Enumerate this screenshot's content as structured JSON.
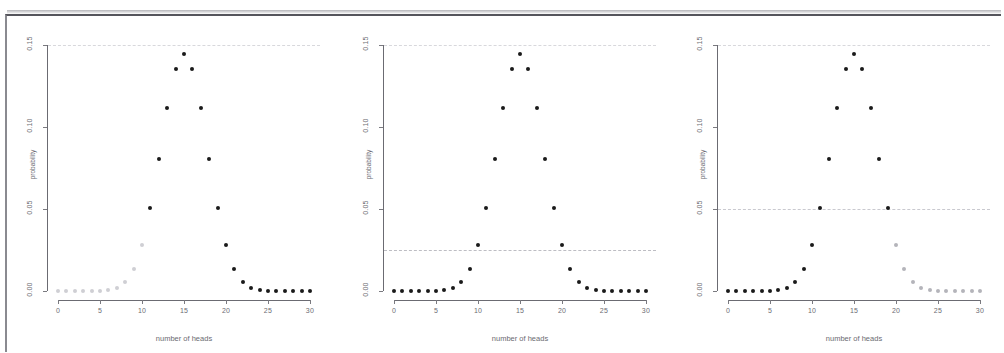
{
  "figure": {
    "panel_count": 3,
    "scan_frame": true
  },
  "chart_data": [
    {
      "type": "scatter",
      "title": "",
      "xlabel": "number of heads",
      "ylabel": "probability",
      "xlim": [
        -1.2,
        31.2
      ],
      "ylim": [
        0.0,
        0.152
      ],
      "xticks": [
        0,
        5,
        10,
        15,
        20,
        25,
        30
      ],
      "xticklabels": [
        "0",
        "5",
        "10",
        "15",
        "20",
        "25",
        "30"
      ],
      "yticks": [
        0.0,
        0.05,
        0.1,
        0.15
      ],
      "yticklabels": [
        "0.00",
        "0.05",
        "0.10",
        "0.15"
      ],
      "grid": false,
      "legend": "none",
      "x": [
        0,
        1,
        2,
        3,
        4,
        5,
        6,
        7,
        8,
        9,
        10,
        11,
        12,
        13,
        14,
        15,
        16,
        17,
        18,
        19,
        20,
        21,
        22,
        23,
        24,
        25,
        26,
        27,
        28,
        29,
        30
      ],
      "values": [
        0.0,
        0.0,
        0.0,
        0.0,
        0.0,
        0.0001,
        0.0006,
        0.0019,
        0.0055,
        0.0133,
        0.028,
        0.0509,
        0.0806,
        0.1115,
        0.1354,
        0.1445,
        0.1354,
        0.1115,
        0.0806,
        0.0509,
        0.028,
        0.0133,
        0.0055,
        0.0019,
        0.0006,
        0.0001,
        0.0,
        0.0,
        0.0,
        0.0,
        0.0
      ],
      "highlight_color": "#1a1a1a",
      "faded_color": "#cfcfd4",
      "highlight_from_x": 11,
      "highlight_to_x": 30,
      "reference_lines": [
        {
          "y": 0.15,
          "style": "dashed",
          "color": "#d8d8dc"
        }
      ],
      "annotation": "right tail emphasized (x >= 11)"
    },
    {
      "type": "scatter",
      "title": "",
      "xlabel": "number of heads",
      "ylabel": "probability",
      "xlim": [
        -1.2,
        31.2
      ],
      "ylim": [
        0.0,
        0.152
      ],
      "xticks": [
        0,
        5,
        10,
        15,
        20,
        25,
        30
      ],
      "xticklabels": [
        "0",
        "5",
        "10",
        "15",
        "20",
        "25",
        "30"
      ],
      "yticks": [
        0.0,
        0.05,
        0.1,
        0.15
      ],
      "yticklabels": [
        "0.00",
        "0.05",
        "0.10",
        "0.15"
      ],
      "grid": false,
      "legend": "none",
      "x": [
        0,
        1,
        2,
        3,
        4,
        5,
        6,
        7,
        8,
        9,
        10,
        11,
        12,
        13,
        14,
        15,
        16,
        17,
        18,
        19,
        20,
        21,
        22,
        23,
        24,
        25,
        26,
        27,
        28,
        29,
        30
      ],
      "values": [
        0.0,
        0.0,
        0.0,
        0.0,
        0.0,
        0.0001,
        0.0006,
        0.0019,
        0.0055,
        0.0133,
        0.028,
        0.0509,
        0.0806,
        0.1115,
        0.1354,
        0.1445,
        0.1354,
        0.1115,
        0.0806,
        0.0509,
        0.028,
        0.0133,
        0.0055,
        0.0019,
        0.0006,
        0.0001,
        0.0,
        0.0,
        0.0,
        0.0,
        0.0
      ],
      "highlight_color": "#1a1a1a",
      "faded_color": "#1a1a1a",
      "highlight_from_x": 0,
      "highlight_to_x": 30,
      "reference_lines": [
        {
          "y": 0.15,
          "style": "dashed",
          "color": "#d8d8dc"
        },
        {
          "y": 0.025,
          "style": "dashed",
          "color": "#bdbdc3"
        }
      ],
      "annotation": "all points dark, reference line at 0.025"
    },
    {
      "type": "scatter",
      "title": "",
      "xlabel": "number of heads",
      "ylabel": "probability",
      "xlim": [
        -1.2,
        31.2
      ],
      "ylim": [
        0.0,
        0.152
      ],
      "xticks": [
        0,
        5,
        10,
        15,
        20,
        25,
        30
      ],
      "xticklabels": [
        "0",
        "5",
        "10",
        "15",
        "20",
        "25",
        "30"
      ],
      "yticks": [
        0.0,
        0.05,
        0.1,
        0.15
      ],
      "yticklabels": [
        "0.00",
        "0.05",
        "0.10",
        "0.15"
      ],
      "grid": false,
      "legend": "none",
      "x": [
        0,
        1,
        2,
        3,
        4,
        5,
        6,
        7,
        8,
        9,
        10,
        11,
        12,
        13,
        14,
        15,
        16,
        17,
        18,
        19,
        20,
        21,
        22,
        23,
        24,
        25,
        26,
        27,
        28,
        29,
        30
      ],
      "values": [
        0.0,
        0.0,
        0.0,
        0.0,
        0.0,
        0.0001,
        0.0006,
        0.0019,
        0.0055,
        0.0133,
        0.028,
        0.0509,
        0.0806,
        0.1115,
        0.1354,
        0.1445,
        0.1354,
        0.1115,
        0.0806,
        0.0509,
        0.028,
        0.0133,
        0.0055,
        0.0019,
        0.0006,
        0.0001,
        0.0,
        0.0,
        0.0,
        0.0,
        0.0
      ],
      "highlight_color": "#1a1a1a",
      "faded_color": "#b4b4ba",
      "highlight_from_x": 0,
      "highlight_to_x": 19,
      "reference_lines": [
        {
          "y": 0.15,
          "style": "dashed",
          "color": "#d8d8dc"
        },
        {
          "y": 0.05,
          "style": "dashed",
          "color": "#c9c9cf"
        }
      ],
      "annotation": "left side emphasized (x <= 19), reference line at 0.05"
    }
  ]
}
